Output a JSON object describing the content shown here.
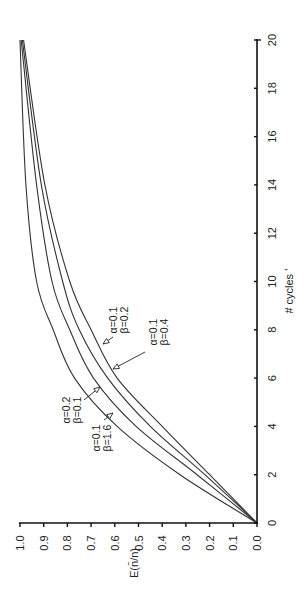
{
  "chart_data": {
    "type": "line",
    "orientation": "rotated-90-ccw",
    "title": "",
    "xlabel": "# cycles",
    "ylabel": "E(n̄/n)",
    "xlim": [
      0,
      20
    ],
    "ylim": [
      0.0,
      1.0
    ],
    "x_ticks": [
      0,
      2,
      4,
      6,
      8,
      10,
      12,
      14,
      16,
      18,
      20
    ],
    "y_ticks": [
      "0.0",
      "0.1",
      "0.2",
      "0.3",
      "0.4",
      "0.5",
      "0.6",
      "0.7",
      "0.8",
      "0.9",
      "1.0"
    ],
    "grid": false,
    "legend": "inline annotations with arrows",
    "x": [
      0,
      2,
      4,
      6,
      8,
      10,
      14,
      20
    ],
    "series": [
      {
        "name": "α=0.2 β=0.1",
        "values": [
          0.0,
          0.325,
          0.59,
          0.77,
          0.86,
          0.93,
          0.975,
          1.0
        ]
      },
      {
        "name": "α=0.1 β=1.6",
        "values": [
          0.0,
          0.253,
          0.51,
          0.69,
          0.79,
          0.865,
          0.93,
          0.995
        ]
      },
      {
        "name": "α=0.1 β=0.4",
        "values": [
          0.0,
          0.22,
          0.45,
          0.63,
          0.75,
          0.82,
          0.91,
          0.99
        ]
      },
      {
        "name": "α=0.1 β=0.2",
        "values": [
          0.0,
          0.2,
          0.4,
          0.59,
          0.7,
          0.79,
          0.895,
          0.985
        ]
      }
    ],
    "annotations": [
      {
        "line1": "α=0.2",
        "line2": "β=0.1",
        "target": "α=0.2 β=0.1"
      },
      {
        "line1": "α=0.1",
        "line2": "β=1.6",
        "target": "α=0.1 β=1.6"
      },
      {
        "line1": "α=0.1",
        "line2": "β=0.2",
        "target": "α=0.1 β=0.2"
      },
      {
        "line1": "α=0.1",
        "line2": "β=0.4",
        "target": "α=0.1 β=0.4"
      }
    ]
  }
}
